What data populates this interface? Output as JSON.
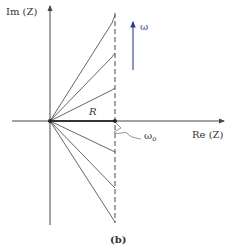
{
  "figure": {
    "caption": "(b)",
    "axes": {
      "y_label": "Im (Z)",
      "x_label": "Re (Z)"
    },
    "labels": {
      "resistance": "R",
      "resonance_freq": "ω",
      "resonance_freq_sub": "o",
      "frequency": "ω"
    },
    "colors": {
      "lines": "#555555",
      "axes": "#444444",
      "frequency_arrow": "#2b3f8f",
      "background": "#ffffff"
    },
    "geometry": {
      "origin": [
        50,
        121
      ],
      "dashed_line_x": 115,
      "ray_endpoints_y": [
        15,
        53,
        88,
        152,
        188,
        222
      ]
    }
  }
}
